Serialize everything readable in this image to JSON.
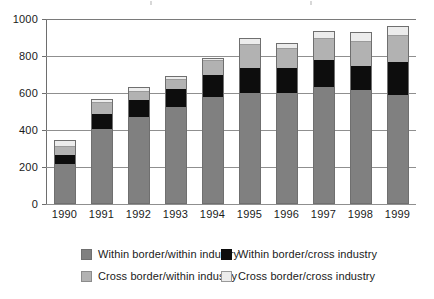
{
  "chart_data": {
    "type": "bar",
    "stacked": true,
    "title": "",
    "subtitle": "",
    "xlabel": "",
    "ylabel": "",
    "categories": [
      "1990",
      "1991",
      "1992",
      "1993",
      "1994",
      "1995",
      "1996",
      "1997",
      "1998",
      "1999"
    ],
    "ylim": [
      0,
      1000
    ],
    "yticks": [
      0,
      200,
      400,
      600,
      800,
      1000
    ],
    "ytick_labels": [
      "0",
      "200",
      "400",
      "600",
      "800",
      "1000"
    ],
    "grid": true,
    "legend_position": "bottom",
    "series": [
      {
        "name": "Within border/within industry",
        "color": "#808080",
        "values": [
          215,
          405,
          470,
          525,
          580,
          600,
          600,
          635,
          615,
          590
        ]
      },
      {
        "name": "Within border/cross industry",
        "color": "#0d0d0d",
        "values": [
          50,
          80,
          90,
          95,
          115,
          135,
          135,
          145,
          130,
          180
        ]
      },
      {
        "name": "Cross border/within industry",
        "color": "#b2b2b2",
        "values": [
          45,
          60,
          45,
          50,
          80,
          125,
          105,
          110,
          130,
          140
        ]
      },
      {
        "name": "Cross border/cross industry",
        "color": "#ececec",
        "values": [
          35,
          25,
          30,
          20,
          15,
          40,
          30,
          45,
          55,
          55
        ]
      }
    ],
    "totals": [
      345,
      570,
      635,
      690,
      790,
      900,
      870,
      935,
      930,
      965
    ]
  },
  "legend": {
    "entries": [
      {
        "label": "Within border/within industry",
        "swatch": "s0"
      },
      {
        "label": "Within border/cross industry",
        "swatch": "s1"
      },
      {
        "label": "Cross border/within industry",
        "swatch": "s2"
      },
      {
        "label": "Cross border/cross industry",
        "swatch": "s3"
      }
    ]
  }
}
